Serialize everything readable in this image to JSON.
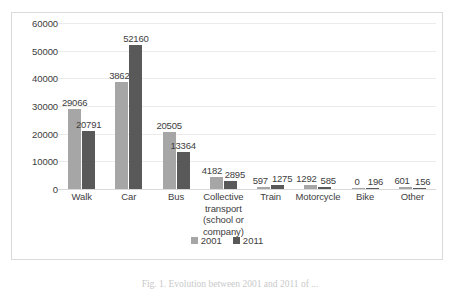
{
  "chart_data": {
    "type": "bar",
    "title": "",
    "xlabel": "",
    "ylabel": "",
    "ylim": [
      0,
      60000
    ],
    "yticks": [
      0,
      10000,
      20000,
      30000,
      40000,
      50000,
      60000
    ],
    "ytick_labels": [
      "0",
      "10000",
      "20000",
      "30000",
      "40000",
      "50000",
      "60000"
    ],
    "grid": true,
    "legend_position": "bottom",
    "categories": [
      "Walk",
      "Car",
      "Bus",
      "Collective transport (school or company)",
      "Train",
      "Motorcycle",
      "Bike",
      "Other"
    ],
    "category_label_lines": [
      [
        "Walk"
      ],
      [
        "Car"
      ],
      [
        "Bus"
      ],
      [
        "Collective",
        "transport",
        "(school or",
        "company)"
      ],
      [
        "Train"
      ],
      [
        "Motorcycle"
      ],
      [
        "Bike"
      ],
      [
        "Other"
      ]
    ],
    "series": [
      {
        "name": "2001",
        "color": "#a6a6a6",
        "values": [
          29066,
          38622,
          20505,
          4182,
          597,
          1292,
          0,
          601
        ],
        "value_labels": [
          "29066",
          "38622",
          "20505",
          "4182",
          "597",
          "1292",
          "0",
          "601"
        ]
      },
      {
        "name": "2011",
        "color": "#595959",
        "values": [
          20791,
          52160,
          13364,
          2895,
          1275,
          585,
          196,
          156
        ],
        "value_labels": [
          "20791",
          "52160",
          "13364",
          "2895",
          "1275",
          "585",
          "196",
          "156"
        ]
      }
    ]
  },
  "legend": {
    "items": [
      {
        "label": "2001",
        "series": "s2001"
      },
      {
        "label": "2011",
        "series": "s2011"
      }
    ]
  },
  "caption": {
    "text": "Fig. 1. Evolution between 2001 and 2011 of ..."
  },
  "colors": {
    "series_2001": "#a6a6a6",
    "series_2011": "#595959",
    "gridline": "#ebebeb",
    "axis": "#d9d9d9",
    "frame_border": "#d9d9d9",
    "text": "#404040",
    "background": "#ffffff"
  }
}
